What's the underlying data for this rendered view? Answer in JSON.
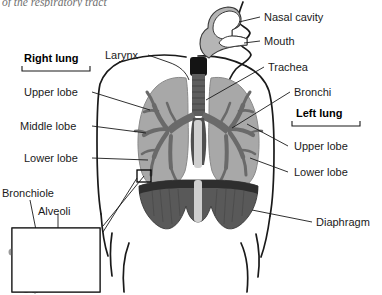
{
  "figure": {
    "title_partial": "of the respiratory tract",
    "width": 382,
    "height": 295
  },
  "colors": {
    "background": "#ffffff",
    "outline": "#1a1a1a",
    "lung_fill": "#a8a8a8",
    "lung_edge": "#8e8e8e",
    "bronchial_tree": "#6a6a6a",
    "trachea": "#5e5e5e",
    "larynx_dark": "#141414",
    "nasal_cavity": "#b5b5b5",
    "diaphragm": "#595959",
    "diaphragm_dark": "#3a3a3a",
    "spine_strip": "#cfcfcf",
    "alveoli_fill": "#8f8f8f",
    "alveoli_edge": "#4a4a4a",
    "bronchiole_fill": "#9a9a9a",
    "text": "#1a1a1a"
  },
  "labels": {
    "nasal_cavity": "Nasal cavity",
    "mouth": "Mouth",
    "trachea": "Trachea",
    "bronchi": "Bronchi",
    "larynx": "Larynx",
    "diaphragm": "Diaphragm",
    "bronchiole": "Bronchiole",
    "alveoli": "Alveoli"
  },
  "right_lung": {
    "heading": "Right lung",
    "lobes": [
      {
        "name": "upper-lobe",
        "label": "Upper lobe"
      },
      {
        "name": "middle-lobe",
        "label": "Middle lobe"
      },
      {
        "name": "lower-lobe",
        "label": "Lower lobe"
      }
    ]
  },
  "left_lung": {
    "heading": "Left lung",
    "lobes": [
      {
        "name": "upper-lobe",
        "label": "Upper lobe"
      },
      {
        "name": "lower-lobe",
        "label": "Lower lobe"
      }
    ]
  },
  "inset": {
    "name": "alveoli-magnification-inset",
    "caption_bronchiole": "Bronchiole",
    "caption_alveoli": "Alveoli"
  }
}
